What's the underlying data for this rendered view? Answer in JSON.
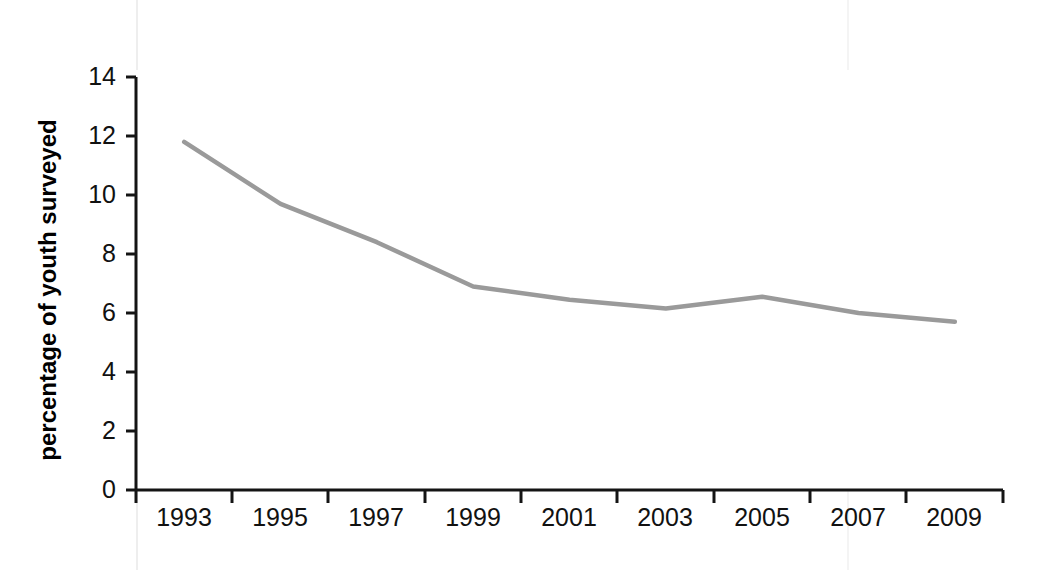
{
  "chart_data": {
    "type": "line",
    "title": "",
    "xlabel": "",
    "ylabel": "percentage of youth surveyed",
    "categories": [
      "1993",
      "1995",
      "1997",
      "1999",
      "2001",
      "2003",
      "2005",
      "2007",
      "2009"
    ],
    "x": [
      1993,
      1995,
      1997,
      1999,
      2001,
      2003,
      2005,
      2007,
      2009
    ],
    "values": [
      11.8,
      9.7,
      8.4,
      6.9,
      6.45,
      6.15,
      6.55,
      6.0,
      5.7
    ],
    "series": [
      {
        "name": "percentage of youth surveyed",
        "values": [
          11.8,
          9.7,
          8.4,
          6.9,
          6.45,
          6.15,
          6.55,
          6.0,
          5.7
        ],
        "color": "#9a9a9a"
      }
    ],
    "ylim": [
      0,
      14
    ],
    "yticks": [
      0,
      2,
      4,
      6,
      8,
      10,
      12,
      14
    ],
    "ytick_labels": [
      "0",
      "2",
      "4",
      "6",
      "8",
      "10",
      "12",
      "14"
    ],
    "xlim": [
      1992,
      2010
    ],
    "xticks": [
      1992,
      1994,
      1996,
      1998,
      2000,
      2002,
      2004,
      2006,
      2008,
      2010
    ],
    "grid": false,
    "legend": "none",
    "line_color": "#9a9a9a",
    "line_width": 4.5,
    "axis_color": "#141414",
    "background": "#ffffff"
  },
  "axes": {
    "y_title": "percentage of youth surveyed",
    "y_tick_labels": [
      "14",
      "12",
      "10",
      "8",
      "6",
      "4",
      "2",
      "0"
    ],
    "x_tick_labels": [
      "1993",
      "1995",
      "1997",
      "1999",
      "2001",
      "2003",
      "2005",
      "2007",
      "2009"
    ]
  }
}
